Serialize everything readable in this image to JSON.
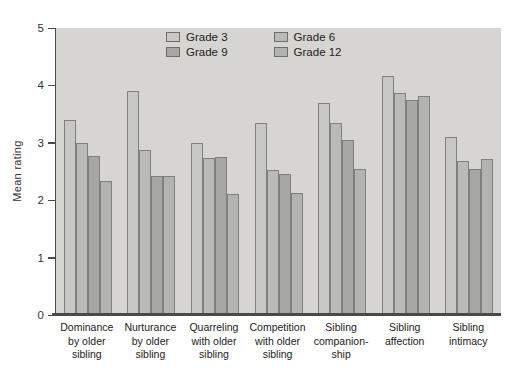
{
  "chart_data": {
    "type": "bar",
    "title": "",
    "ylabel": "Mean rating",
    "xlabel": "",
    "ylim": [
      0,
      5
    ],
    "yticks": [
      0,
      1,
      2,
      3,
      4,
      5
    ],
    "grid": false,
    "legend_position": "top-center",
    "plot_background": "#d6d5d1",
    "axis_color": "#4a4a4a",
    "bar_border_color": "#80807a",
    "categories": [
      "Dominance\nby older\nsibling",
      "Nurturance\nby older\nsibling",
      "Quarreling\nwith older\nsibling",
      "Competition\nwith older\nsibling",
      "Sibling\ncompanion-\nship",
      "Sibling\naffection",
      "Sibling\nintimacy"
    ],
    "series": [
      {
        "name": "Grade 3",
        "color": "#c7c7c3",
        "values": [
          3.4,
          3.9,
          3.0,
          3.35,
          3.7,
          4.17,
          3.1
        ]
      },
      {
        "name": "Grade 6",
        "color": "#babab6",
        "values": [
          3.0,
          2.88,
          2.73,
          2.52,
          3.35,
          3.87,
          2.68
        ]
      },
      {
        "name": "Grade 9",
        "color": "#a6a6a2",
        "values": [
          2.77,
          2.43,
          2.75,
          2.46,
          3.05,
          3.75,
          2.54
        ]
      },
      {
        "name": "Grade 12",
        "color": "#b3b3af",
        "values": [
          2.33,
          2.43,
          2.1,
          2.12,
          2.54,
          3.82,
          2.72
        ]
      }
    ]
  }
}
